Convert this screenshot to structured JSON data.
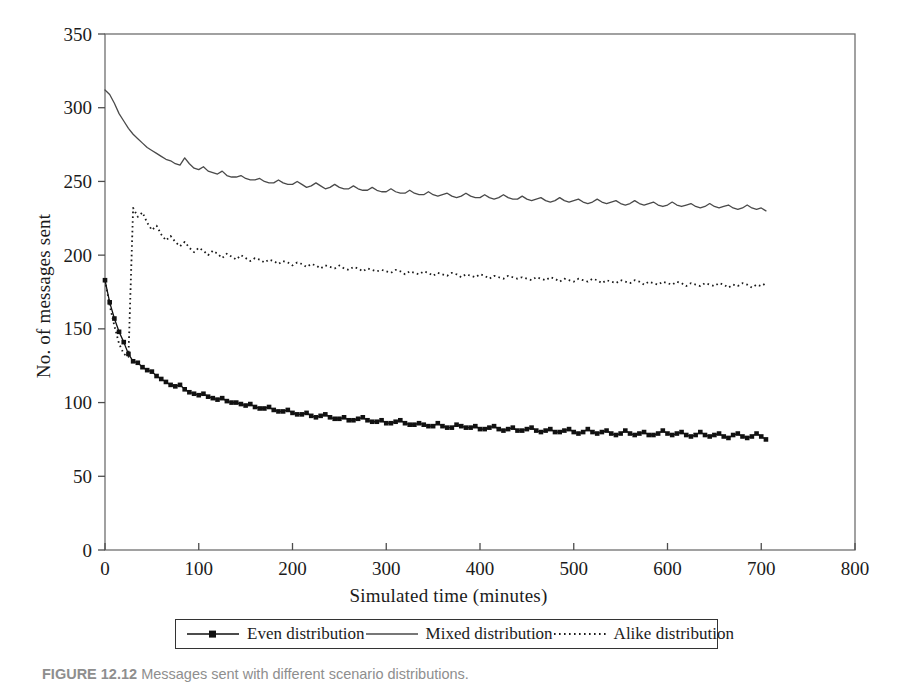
{
  "figure": {
    "caption_label": "FIGURE 12.12",
    "caption_text": "Messages sent with different scenario distributions."
  },
  "chart_data": {
    "type": "line",
    "title": "",
    "subtitle": "",
    "xlabel": "Simulated time (minutes)",
    "ylabel": "No. of messages sent",
    "xlim": [
      0,
      800
    ],
    "ylim": [
      0,
      350
    ],
    "xticks": [
      0,
      100,
      200,
      300,
      400,
      500,
      600,
      700,
      800
    ],
    "yticks": [
      0,
      50,
      100,
      150,
      200,
      250,
      300,
      350
    ],
    "xtick_labels": [
      "0",
      "100",
      "200",
      "300",
      "400",
      "500",
      "600",
      "700",
      "800"
    ],
    "ytick_labels": [
      "0",
      "50",
      "100",
      "150",
      "200",
      "250",
      "300",
      "350"
    ],
    "grid": false,
    "legend_position": "bottom",
    "frame": true,
    "x_data_range": [
      0,
      705
    ],
    "x_sample_step": 5,
    "series": [
      {
        "name": "Even distribution",
        "style": "solid-with-markers",
        "marker": "square",
        "color": "#111111",
        "x": [
          0,
          5,
          10,
          15,
          20,
          25,
          30,
          35,
          40,
          45,
          50,
          55,
          60,
          65,
          70,
          75,
          80,
          85,
          90,
          95,
          100,
          105,
          110,
          115,
          120,
          125,
          130,
          135,
          140,
          145,
          150,
          155,
          160,
          165,
          170,
          175,
          180,
          185,
          190,
          195,
          200,
          205,
          210,
          215,
          220,
          225,
          230,
          235,
          240,
          245,
          250,
          255,
          260,
          265,
          270,
          275,
          280,
          285,
          290,
          295,
          300,
          305,
          310,
          315,
          320,
          325,
          330,
          335,
          340,
          345,
          350,
          355,
          360,
          365,
          370,
          375,
          380,
          385,
          390,
          395,
          400,
          405,
          410,
          415,
          420,
          425,
          430,
          435,
          440,
          445,
          450,
          455,
          460,
          465,
          470,
          475,
          480,
          485,
          490,
          495,
          500,
          505,
          510,
          515,
          520,
          525,
          530,
          535,
          540,
          545,
          550,
          555,
          560,
          565,
          570,
          575,
          580,
          585,
          590,
          595,
          600,
          605,
          610,
          615,
          620,
          625,
          630,
          635,
          640,
          645,
          650,
          655,
          660,
          665,
          670,
          675,
          680,
          685,
          690,
          695,
          700,
          705
        ],
        "values": [
          183,
          168,
          157,
          148,
          141,
          133,
          128,
          127,
          124,
          122,
          121,
          118,
          116,
          114,
          112,
          111,
          112,
          109,
          107,
          106,
          105,
          106,
          104,
          103,
          102,
          103,
          101,
          100,
          100,
          99,
          98,
          99,
          97,
          96,
          96,
          97,
          95,
          94,
          94,
          95,
          93,
          92,
          92,
          93,
          91,
          90,
          91,
          92,
          90,
          89,
          89,
          90,
          88,
          88,
          89,
          90,
          88,
          87,
          87,
          88,
          86,
          86,
          87,
          88,
          86,
          85,
          85,
          86,
          85,
          84,
          84,
          86,
          84,
          83,
          83,
          85,
          84,
          83,
          83,
          84,
          82,
          82,
          83,
          84,
          82,
          81,
          82,
          83,
          81,
          81,
          82,
          83,
          81,
          80,
          81,
          82,
          80,
          80,
          81,
          82,
          80,
          79,
          80,
          82,
          80,
          79,
          80,
          81,
          79,
          78,
          79,
          81,
          79,
          78,
          79,
          80,
          78,
          78,
          79,
          81,
          79,
          78,
          79,
          80,
          78,
          77,
          78,
          80,
          78,
          77,
          78,
          79,
          77,
          76,
          78,
          79,
          77,
          76,
          77,
          79,
          77,
          75
        ]
      },
      {
        "name": "Mixed distribution",
        "style": "solid",
        "marker": "none",
        "color": "#4a4a4a",
        "x": [
          0,
          5,
          10,
          15,
          20,
          25,
          30,
          35,
          40,
          45,
          50,
          55,
          60,
          65,
          70,
          75,
          80,
          85,
          90,
          95,
          100,
          105,
          110,
          115,
          120,
          125,
          130,
          135,
          140,
          145,
          150,
          155,
          160,
          165,
          170,
          175,
          180,
          185,
          190,
          195,
          200,
          205,
          210,
          215,
          220,
          225,
          230,
          235,
          240,
          245,
          250,
          255,
          260,
          265,
          270,
          275,
          280,
          285,
          290,
          295,
          300,
          305,
          310,
          315,
          320,
          325,
          330,
          335,
          340,
          345,
          350,
          355,
          360,
          365,
          370,
          375,
          380,
          385,
          390,
          395,
          400,
          405,
          410,
          415,
          420,
          425,
          430,
          435,
          440,
          445,
          450,
          455,
          460,
          465,
          470,
          475,
          480,
          485,
          490,
          495,
          500,
          505,
          510,
          515,
          520,
          525,
          530,
          535,
          540,
          545,
          550,
          555,
          560,
          565,
          570,
          575,
          580,
          585,
          590,
          595,
          600,
          605,
          610,
          615,
          620,
          625,
          630,
          635,
          640,
          645,
          650,
          655,
          660,
          665,
          670,
          675,
          680,
          685,
          690,
          695,
          700,
          705
        ],
        "values": [
          312,
          309,
          303,
          296,
          291,
          286,
          282,
          279,
          276,
          273,
          271,
          269,
          267,
          265,
          264,
          262,
          261,
          266,
          262,
          259,
          258,
          260,
          257,
          256,
          255,
          257,
          254,
          253,
          253,
          254,
          252,
          251,
          251,
          252,
          250,
          249,
          249,
          251,
          249,
          248,
          248,
          250,
          248,
          246,
          247,
          249,
          247,
          245,
          246,
          248,
          246,
          245,
          245,
          247,
          245,
          244,
          244,
          246,
          244,
          243,
          243,
          245,
          243,
          242,
          242,
          244,
          242,
          241,
          241,
          243,
          241,
          240,
          241,
          242,
          240,
          239,
          240,
          242,
          240,
          239,
          239,
          241,
          239,
          238,
          239,
          241,
          239,
          238,
          238,
          240,
          238,
          237,
          238,
          239,
          237,
          236,
          237,
          239,
          237,
          236,
          237,
          238,
          236,
          235,
          236,
          238,
          236,
          235,
          236,
          237,
          235,
          234,
          235,
          237,
          235,
          234,
          235,
          236,
          234,
          233,
          234,
          236,
          234,
          233,
          234,
          235,
          233,
          232,
          233,
          235,
          233,
          232,
          233,
          234,
          232,
          231,
          232,
          234,
          232,
          231,
          232,
          230
        ]
      },
      {
        "name": "Alike distribution",
        "style": "dotted",
        "marker": "none",
        "color": "#1a1a1a",
        "x": [
          0,
          5,
          10,
          15,
          20,
          25,
          30,
          35,
          40,
          45,
          50,
          55,
          60,
          65,
          70,
          75,
          80,
          85,
          90,
          95,
          100,
          105,
          110,
          115,
          120,
          125,
          130,
          135,
          140,
          145,
          150,
          155,
          160,
          165,
          170,
          175,
          180,
          185,
          190,
          195,
          200,
          205,
          210,
          215,
          220,
          225,
          230,
          235,
          240,
          245,
          250,
          255,
          260,
          265,
          270,
          275,
          280,
          285,
          290,
          295,
          300,
          305,
          310,
          315,
          320,
          325,
          330,
          335,
          340,
          345,
          350,
          355,
          360,
          365,
          370,
          375,
          380,
          385,
          390,
          395,
          400,
          405,
          410,
          415,
          420,
          425,
          430,
          435,
          440,
          445,
          450,
          455,
          460,
          465,
          470,
          475,
          480,
          485,
          490,
          495,
          500,
          505,
          510,
          515,
          520,
          525,
          530,
          535,
          540,
          545,
          550,
          555,
          560,
          565,
          570,
          575,
          580,
          585,
          590,
          595,
          600,
          605,
          610,
          615,
          620,
          625,
          630,
          635,
          640,
          645,
          650,
          655,
          660,
          665,
          670,
          675,
          680,
          685,
          690,
          695,
          700,
          705
        ],
        "values": [
          183,
          166,
          152,
          140,
          133,
          131,
          232,
          226,
          229,
          222,
          217,
          220,
          214,
          210,
          213,
          209,
          206,
          209,
          205,
          202,
          205,
          203,
          200,
          203,
          201,
          198,
          201,
          199,
          197,
          200,
          198,
          196,
          198,
          197,
          195,
          197,
          196,
          194,
          196,
          195,
          193,
          195,
          194,
          192,
          194,
          193,
          191,
          193,
          192,
          191,
          193,
          191,
          190,
          192,
          191,
          189,
          191,
          190,
          189,
          190,
          189,
          188,
          190,
          189,
          187,
          189,
          188,
          187,
          189,
          188,
          186,
          188,
          187,
          186,
          188,
          187,
          185,
          187,
          186,
          185,
          187,
          186,
          184,
          186,
          185,
          184,
          186,
          185,
          184,
          185,
          184,
          183,
          185,
          184,
          183,
          185,
          184,
          182,
          184,
          183,
          182,
          184,
          183,
          182,
          184,
          183,
          181,
          183,
          182,
          181,
          183,
          182,
          181,
          183,
          182,
          180,
          182,
          181,
          180,
          182,
          181,
          180,
          182,
          181,
          179,
          181,
          180,
          179,
          181,
          180,
          179,
          181,
          180,
          178,
          180,
          179,
          181,
          180,
          178,
          180,
          179,
          181
        ]
      }
    ]
  }
}
